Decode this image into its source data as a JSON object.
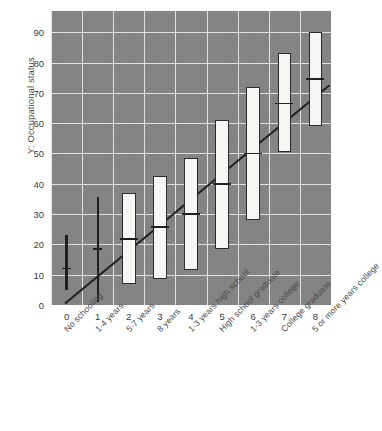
{
  "chart_data": {
    "type": "box",
    "title": "",
    "xlabel": "",
    "ylabel": "Y: Occupational status",
    "ylim": [
      0,
      97
    ],
    "yticks": [
      0,
      10,
      20,
      30,
      40,
      50,
      60,
      70,
      80,
      90
    ],
    "xticks": [
      0,
      1,
      2,
      3,
      4,
      5,
      6,
      7,
      8
    ],
    "grid": true,
    "legend": "none",
    "plot_bg_color": "#838383",
    "gridline_color": "#e8e8e8",
    "box_fill_color": "#f6f6f4",
    "box_edge_color": "#2b2b2b",
    "regression_line_color": "#1f1f1f",
    "categories": [
      "No schooling",
      "1-4 years",
      "5-7 years",
      "8 years",
      "1-3 years high school",
      "High school graduate",
      "1-3 years college",
      "College graduate",
      "5 or more years college"
    ],
    "boxes": [
      {
        "x": 0,
        "label": "No schooling",
        "lower": 5,
        "upper": 23,
        "median": 12,
        "degenerate": true
      },
      {
        "x": 1,
        "label": "1-4 years",
        "lower": 1,
        "upper": 35.5,
        "median": 18.5,
        "degenerate": true
      },
      {
        "x": 2,
        "label": "5-7 years",
        "lower": 7,
        "upper": 37,
        "median": 21.7,
        "degenerate": false
      },
      {
        "x": 3,
        "label": "8 years",
        "lower": 8.7,
        "upper": 42.5,
        "median": 25.7,
        "degenerate": false
      },
      {
        "x": 4,
        "label": "1-3 years high school",
        "lower": 11.7,
        "upper": 48.5,
        "median": 30,
        "degenerate": false
      },
      {
        "x": 5,
        "label": "High school graduate",
        "lower": 18.5,
        "upper": 61,
        "median": 40,
        "degenerate": false
      },
      {
        "x": 6,
        "label": "1-3 years college",
        "lower": 28,
        "upper": 72,
        "median": 50,
        "degenerate": false
      },
      {
        "x": 7,
        "label": "College graduate",
        "lower": 50.5,
        "upper": 83,
        "median": 66.5,
        "degenerate": false
      },
      {
        "x": 8,
        "label": "5 or more years college",
        "lower": 59,
        "upper": 90,
        "median": 74.5,
        "degenerate": false
      }
    ],
    "regression_line": {
      "x_start": -0.05,
      "y_start": 0.5,
      "x_end": 8.45,
      "y_end": 72.5,
      "description": "fitted least-squares line through group medians"
    }
  }
}
